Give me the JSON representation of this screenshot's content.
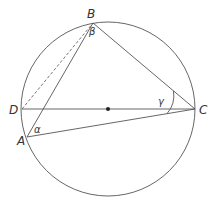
{
  "diagram": {
    "type": "geometry",
    "colors": {
      "stroke": "#555555",
      "text": "#333333",
      "background": "#ffffff"
    },
    "circle": {
      "cx": 108,
      "cy": 109,
      "r": 87
    },
    "center_dot": {
      "cx": 108,
      "cy": 109
    },
    "points": {
      "A": {
        "label": "A",
        "x": 27,
        "y": 137
      },
      "B": {
        "label": "B",
        "x": 93,
        "y": 23
      },
      "C": {
        "label": "C",
        "x": 195,
        "y": 109
      },
      "D": {
        "label": "D",
        "x": 22,
        "y": 109
      }
    },
    "segments": [
      {
        "from": "A",
        "to": "B",
        "style": "solid"
      },
      {
        "from": "B",
        "to": "C",
        "style": "solid"
      },
      {
        "from": "A",
        "to": "C",
        "style": "solid"
      },
      {
        "from": "D",
        "to": "C",
        "style": "solid"
      },
      {
        "from": "D",
        "to": "B",
        "style": "dashed"
      }
    ],
    "angles": {
      "alpha": {
        "label": "α",
        "vertex": "A"
      },
      "beta": {
        "label": "β",
        "vertex": "B"
      },
      "gamma": {
        "label": "γ",
        "vertex": "C"
      }
    }
  }
}
